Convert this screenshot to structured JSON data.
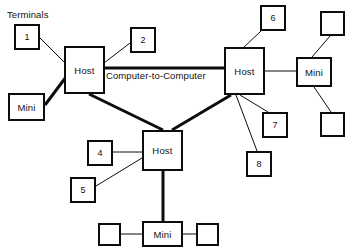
{
  "diagram": {
    "background_color": "#ffffff",
    "line_color": "#0d0d0d",
    "labels": {
      "terminals": "Terminals",
      "computer_to_computer": "Computer-to-Computer"
    },
    "nodes": [
      {
        "id": "term1",
        "label": "1",
        "kind": "terminal",
        "x": 14,
        "y": 24,
        "w": 26,
        "h": 26
      },
      {
        "id": "term2",
        "label": "2",
        "kind": "terminal",
        "x": 130,
        "y": 27,
        "w": 26,
        "h": 26
      },
      {
        "id": "term4",
        "label": "4",
        "kind": "terminal",
        "x": 87,
        "y": 140,
        "w": 26,
        "h": 26
      },
      {
        "id": "term5",
        "label": "5",
        "kind": "terminal",
        "x": 70,
        "y": 177,
        "w": 26,
        "h": 26
      },
      {
        "id": "term6",
        "label": "6",
        "kind": "terminal",
        "x": 260,
        "y": 5,
        "w": 26,
        "h": 26
      },
      {
        "id": "term7",
        "label": "7",
        "kind": "terminal",
        "x": 262,
        "y": 112,
        "w": 26,
        "h": 26
      },
      {
        "id": "term8",
        "label": "8",
        "kind": "terminal",
        "x": 246,
        "y": 151,
        "w": 26,
        "h": 26
      },
      {
        "id": "hostLeft",
        "label": "Host",
        "kind": "host",
        "x": 64,
        "y": 46,
        "w": 41,
        "h": 48
      },
      {
        "id": "hostRight",
        "label": "Host",
        "kind": "host",
        "x": 224,
        "y": 47,
        "w": 41,
        "h": 48
      },
      {
        "id": "hostCenter",
        "label": "Host",
        "kind": "host",
        "x": 142,
        "y": 130,
        "w": 41,
        "h": 41
      },
      {
        "id": "miniLeft",
        "label": "Mini",
        "kind": "mini",
        "x": 8,
        "y": 93,
        "w": 37,
        "h": 28
      },
      {
        "id": "miniRight",
        "label": "Mini",
        "kind": "mini",
        "x": 296,
        "y": 57,
        "w": 36,
        "h": 30
      },
      {
        "id": "miniBottom",
        "label": "Mini",
        "kind": "mini",
        "x": 142,
        "y": 221,
        "w": 41,
        "h": 26
      },
      {
        "id": "boxTR",
        "label": "",
        "kind": "empty",
        "x": 320,
        "y": 11,
        "w": 25,
        "h": 25
      },
      {
        "id": "boxBR",
        "label": "",
        "kind": "empty",
        "x": 320,
        "y": 112,
        "w": 25,
        "h": 25
      },
      {
        "id": "boxBL",
        "label": "",
        "kind": "empty",
        "x": 98,
        "y": 223,
        "w": 23,
        "h": 23
      },
      {
        "id": "boxBC",
        "label": "",
        "kind": "empty",
        "x": 196,
        "y": 223,
        "w": 23,
        "h": 23
      }
    ],
    "edges": [
      {
        "from": "term1",
        "to": "hostLeft",
        "x1": 40,
        "y1": 38,
        "x2": 65,
        "y2": 63,
        "weight": "thin"
      },
      {
        "from": "term2",
        "to": "hostLeft",
        "x1": 130,
        "y1": 43,
        "x2": 104,
        "y2": 63,
        "weight": "thin"
      },
      {
        "from": "miniLeft",
        "to": "hostLeft",
        "x1": 45,
        "y1": 105,
        "x2": 66,
        "y2": 77,
        "weight": "thick"
      },
      {
        "from": "hostLeft",
        "to": "hostRight",
        "x1": 105,
        "y1": 68,
        "x2": 224,
        "y2": 68,
        "weight": "thick"
      },
      {
        "from": "hostLeft",
        "to": "hostCenter",
        "x1": 89,
        "y1": 94,
        "x2": 163,
        "y2": 130,
        "weight": "thick"
      },
      {
        "from": "hostRight",
        "to": "hostCenter",
        "x1": 231,
        "y1": 95,
        "x2": 172,
        "y2": 130,
        "weight": "thick"
      },
      {
        "from": "term6",
        "to": "hostRight",
        "x1": 261,
        "y1": 31,
        "x2": 243,
        "y2": 48,
        "weight": "thin"
      },
      {
        "from": "hostRight",
        "to": "miniRight",
        "x1": 265,
        "y1": 71,
        "x2": 296,
        "y2": 71,
        "weight": "thin"
      },
      {
        "from": "miniRight",
        "to": "boxTR",
        "x1": 312,
        "y1": 57,
        "x2": 330,
        "y2": 36,
        "weight": "thin"
      },
      {
        "from": "miniRight",
        "to": "boxBR",
        "x1": 314,
        "y1": 87,
        "x2": 331,
        "y2": 112,
        "weight": "thin"
      },
      {
        "from": "hostRight",
        "to": "term7",
        "x1": 240,
        "y1": 95,
        "x2": 268,
        "y2": 112,
        "weight": "thin"
      },
      {
        "from": "hostRight",
        "to": "term8",
        "x1": 236,
        "y1": 95,
        "x2": 257,
        "y2": 151,
        "weight": "thin"
      },
      {
        "from": "term4",
        "to": "hostCenter",
        "x1": 113,
        "y1": 152,
        "x2": 142,
        "y2": 152,
        "weight": "thin"
      },
      {
        "from": "term5",
        "to": "hostCenter",
        "x1": 96,
        "y1": 186,
        "x2": 142,
        "y2": 158,
        "weight": "thin"
      },
      {
        "from": "hostCenter",
        "to": "miniBottom",
        "x1": 163,
        "y1": 171,
        "x2": 163,
        "y2": 221,
        "weight": "thick"
      },
      {
        "from": "boxBL",
        "to": "miniBottom",
        "x1": 121,
        "y1": 234,
        "x2": 142,
        "y2": 234,
        "weight": "thin"
      },
      {
        "from": "miniBottom",
        "to": "boxBC",
        "x1": 183,
        "y1": 234,
        "x2": 196,
        "y2": 234,
        "weight": "thin"
      }
    ]
  }
}
